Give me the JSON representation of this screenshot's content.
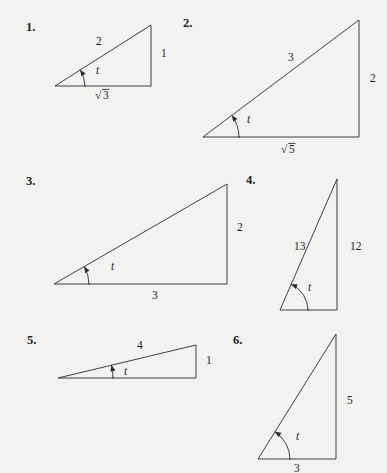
{
  "page": {
    "kind": "math-exercise-figure",
    "background_color": "#f2f2f0",
    "ink_color": "#2b2b2b",
    "angle_symbol": "t"
  },
  "problems": [
    {
      "number": "1.",
      "number_pos": {
        "x": 26,
        "y": 31
      },
      "angle_label": "t",
      "angle_label_pos": {
        "x": 96,
        "y": 74
      },
      "vertex": {
        "x": 55,
        "y": 86
      },
      "corner": {
        "x": 151,
        "y": 86
      },
      "apex": {
        "x": 151,
        "y": 25
      },
      "arc_radius": 30,
      "labels": [
        {
          "text": "2",
          "kind": "plain",
          "pos": {
            "x": 96,
            "y": 45
          }
        },
        {
          "text": "1",
          "kind": "plain",
          "pos": {
            "x": 161,
            "y": 57
          }
        },
        {
          "text": "3",
          "kind": "radical",
          "pos": {
            "x": 95,
            "y": 99
          }
        }
      ]
    },
    {
      "number": "2.",
      "number_pos": {
        "x": 183,
        "y": 27
      },
      "angle_label": "t",
      "angle_label_pos": {
        "x": 247,
        "y": 123
      },
      "vertex": {
        "x": 203,
        "y": 137
      },
      "corner": {
        "x": 359,
        "y": 137
      },
      "apex": {
        "x": 359,
        "y": 20
      },
      "arc_radius": 36,
      "labels": [
        {
          "text": "3",
          "kind": "plain",
          "pos": {
            "x": 288,
            "y": 61
          }
        },
        {
          "text": "2",
          "kind": "plain",
          "pos": {
            "x": 370,
            "y": 82
          }
        },
        {
          "text": "5",
          "kind": "radical",
          "pos": {
            "x": 281,
            "y": 153
          }
        }
      ]
    },
    {
      "number": "3.",
      "number_pos": {
        "x": 26,
        "y": 185
      },
      "angle_label": "t",
      "angle_label_pos": {
        "x": 111,
        "y": 270
      },
      "vertex": {
        "x": 54,
        "y": 284
      },
      "corner": {
        "x": 227,
        "y": 284
      },
      "apex": {
        "x": 227,
        "y": 184
      },
      "arc_radius": 35,
      "labels": [
        {
          "text": "2",
          "kind": "plain",
          "pos": {
            "x": 237,
            "y": 231
          }
        },
        {
          "text": "3",
          "kind": "plain",
          "pos": {
            "x": 152,
            "y": 299
          }
        }
      ]
    },
    {
      "number": "4.",
      "number_pos": {
        "x": 246,
        "y": 184
      },
      "angle_label": "t",
      "angle_label_pos": {
        "x": 308,
        "y": 291
      },
      "vertex": {
        "x": 280,
        "y": 310
      },
      "corner": {
        "x": 337,
        "y": 310
      },
      "apex": {
        "x": 337,
        "y": 179
      },
      "arc_radius": 28,
      "labels": [
        {
          "text": "13",
          "kind": "plain",
          "pos": {
            "x": 294,
            "y": 250
          }
        },
        {
          "text": "12",
          "kind": "plain",
          "pos": {
            "x": 350,
            "y": 250
          }
        }
      ]
    },
    {
      "number": "5.",
      "number_pos": {
        "x": 27,
        "y": 344
      },
      "angle_label": "t",
      "angle_label_pos": {
        "x": 124,
        "y": 375
      },
      "vertex": {
        "x": 58,
        "y": 378
      },
      "corner": {
        "x": 196,
        "y": 378
      },
      "apex": {
        "x": 196,
        "y": 345
      },
      "arc_radius": 55,
      "labels": [
        {
          "text": "4",
          "kind": "plain",
          "pos": {
            "x": 137,
            "y": 349
          }
        },
        {
          "text": "1",
          "kind": "plain",
          "pos": {
            "x": 206,
            "y": 364
          }
        }
      ]
    },
    {
      "number": "6.",
      "number_pos": {
        "x": 233,
        "y": 344
      },
      "angle_label": "t",
      "angle_label_pos": {
        "x": 296,
        "y": 440
      },
      "vertex": {
        "x": 258,
        "y": 459
      },
      "corner": {
        "x": 336,
        "y": 459
      },
      "apex": {
        "x": 336,
        "y": 334
      },
      "arc_radius": 32,
      "labels": [
        {
          "text": "5",
          "kind": "plain",
          "pos": {
            "x": 347,
            "y": 404
          }
        },
        {
          "text": "3",
          "kind": "plain",
          "pos": {
            "x": 294,
            "y": 472
          }
        }
      ]
    }
  ]
}
